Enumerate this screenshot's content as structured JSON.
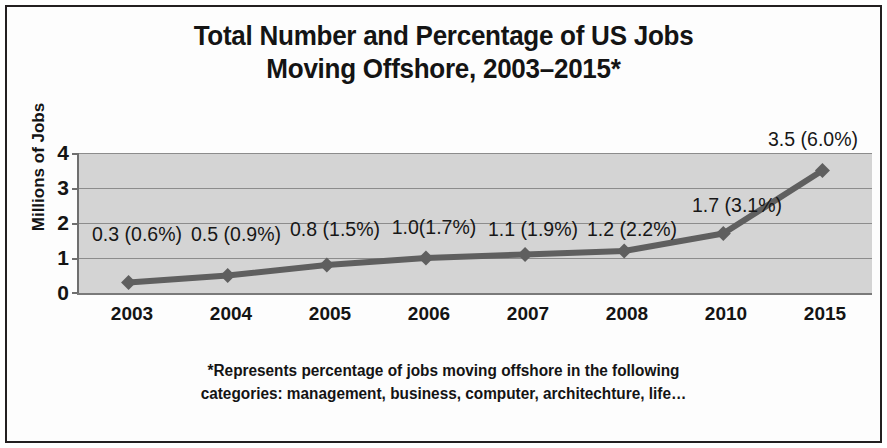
{
  "chart_data": {
    "type": "line",
    "title": "Total Number and Percentage of US Jobs\nMoving Offshore, 2003–2015*",
    "xlabel": "",
    "ylabel": "Millions of Jobs",
    "categories": [
      "2003",
      "2004",
      "2005",
      "2006",
      "2007",
      "2008",
      "2010",
      "2015"
    ],
    "values": [
      0.3,
      0.5,
      0.8,
      1.0,
      1.1,
      1.2,
      1.7,
      3.5
    ],
    "percentages": [
      "0.6%",
      "0.9%",
      "1.5%",
      "1.7%",
      "1.9%",
      "2.2%",
      "3.1%",
      "6.0%"
    ],
    "point_labels": [
      "0.3 (0.6%)",
      "0.5 (0.9%)",
      "0.8 (1.5%)",
      "1.0(1.7%)",
      "1.1 (1.9%)",
      "1.2 (2.2%)",
      "1.7 (3.1%)",
      "3.5 (6.0%)"
    ],
    "ylim": [
      0,
      4
    ],
    "yticks": [
      "0",
      "1",
      "2",
      "3",
      "4"
    ],
    "grid": true,
    "legend": "none",
    "series_color": "#5f5f5f",
    "plot_background": "#d4d4d4",
    "marker": "diamond",
    "footnote": "*Represents percentage of jobs moving offshore in the following\ncategories: management, business, computer, architechture, life…"
  },
  "figure": {
    "border_color": "#231f20",
    "background": "#ffffff",
    "text_color": "#141414"
  }
}
